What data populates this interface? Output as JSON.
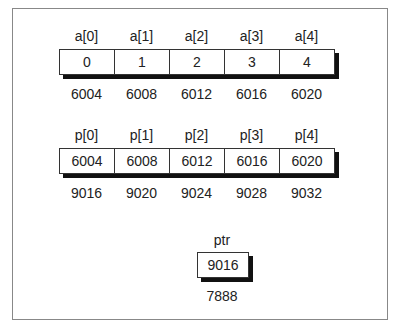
{
  "array_a": {
    "labels": [
      "a[0]",
      "a[1]",
      "a[2]",
      "a[3]",
      "a[4]"
    ],
    "values": [
      "0",
      "1",
      "2",
      "3",
      "4"
    ],
    "addresses": [
      "6004",
      "6008",
      "6012",
      "6016",
      "6020"
    ]
  },
  "array_p": {
    "labels": [
      "p[0]",
      "p[1]",
      "p[2]",
      "p[3]",
      "p[4]"
    ],
    "values": [
      "6004",
      "6008",
      "6012",
      "6016",
      "6020"
    ],
    "addresses": [
      "9016",
      "9020",
      "9024",
      "9028",
      "9032"
    ]
  },
  "ptr": {
    "label": "ptr",
    "value": "9016",
    "address": "7888"
  }
}
